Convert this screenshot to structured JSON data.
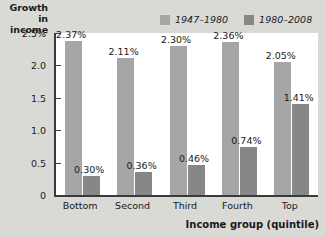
{
  "chart_data": {
    "type": "bar",
    "title": "",
    "xlabel": "Income group  (quintile)",
    "ylabel": "Growth in income",
    "categories": [
      "Bottom",
      "Second",
      "Third",
      "Fourth",
      "Top"
    ],
    "series": [
      {
        "name": "1947–1980",
        "color": "#a6a6a6",
        "values": [
          2.37,
          2.11,
          2.3,
          2.36,
          2.05
        ],
        "labels": [
          "2.37%",
          "2.11%",
          "2.30%",
          "2.36%",
          "2.05%"
        ]
      },
      {
        "name": "1980–2008",
        "color": "#878787",
        "values": [
          0.3,
          0.36,
          0.46,
          0.74,
          1.41
        ],
        "labels": [
          "0.30%",
          "0.36%",
          "0.46%",
          "0.74%",
          "1.41%"
        ]
      }
    ],
    "ylim": [
      0,
      2.5
    ],
    "yticks": [
      0,
      0.5,
      1.0,
      1.5,
      2.0,
      2.5
    ],
    "ytick_labels": [
      "0",
      "0.5",
      "1.0",
      "1.5",
      "2.0",
      "2.5%"
    ],
    "grid": false,
    "legend_position": "top-right"
  },
  "axis": {
    "y_title_line1": "Growth in",
    "y_title_line2": "income",
    "x_title": "Income group  (quintile)"
  },
  "legend": {
    "items": [
      {
        "label": "1947–1980",
        "color": "#a6a6a6"
      },
      {
        "label": "1980–2008",
        "color": "#878787"
      }
    ]
  },
  "colors": {
    "background": "#d9d9d6",
    "plot_background": "#ffffff",
    "axis": "#3a3a3a",
    "series1": "#a6a6a6",
    "series2": "#878787",
    "text": "#1a1a1a"
  }
}
